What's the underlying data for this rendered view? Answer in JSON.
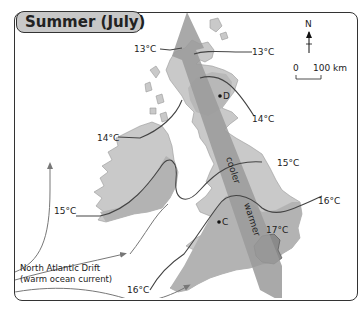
{
  "title": "Summer (July)",
  "compass": {
    "label": "N"
  },
  "scale_bar": {
    "start": "0",
    "end": "100 km"
  },
  "isotherms": [
    {
      "label": "13°C",
      "position": "north-west"
    },
    {
      "label": "13°C",
      "position": "north-east"
    },
    {
      "label": "14°C",
      "position": "west"
    },
    {
      "label": "14°C",
      "position": "east-scotland"
    },
    {
      "label": "15°C",
      "position": "west-ireland"
    },
    {
      "label": "15°C",
      "position": "east-england"
    },
    {
      "label": "16°C",
      "position": "south-west"
    },
    {
      "label": "16°C",
      "position": "east-anglia"
    },
    {
      "label": "17°C",
      "position": "london"
    }
  ],
  "places": [
    {
      "label": "D"
    },
    {
      "label": "C"
    }
  ],
  "gradient_arrow": {
    "cool_label": "cooler",
    "warm_label": "warmer"
  },
  "current": {
    "line1": "North Atlantic Drift",
    "line2": "(warm ocean current)"
  },
  "colors": {
    "land_light": "#c9c9c9",
    "land_warm": "#b0b0b0",
    "arrow": "#9a9a9a",
    "hot_zone": "#8a8a8a",
    "isotherm": "#444444",
    "current": "#777777"
  }
}
